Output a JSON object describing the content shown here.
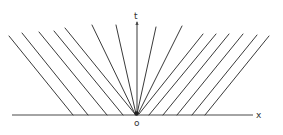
{
  "figure": {
    "labels": {
      "t_axis": "t",
      "x_axis": "x",
      "origin": "o"
    },
    "colors": {
      "line": "#3a3a3a",
      "axis": "#4a4a4a",
      "background": "#ffffff"
    },
    "axes": {
      "x_axis": {
        "x1": 12,
        "y1": 115,
        "x2": 253,
        "y2": 115
      },
      "t_axis": {
        "x1": 137,
        "y1": 115,
        "x2": 137,
        "y2": 22
      }
    },
    "left_lines": [
      {
        "x1": 9,
        "y1": 36,
        "x2": 73,
        "y2": 115
      },
      {
        "x1": 22,
        "y1": 33,
        "x2": 88,
        "y2": 115
      },
      {
        "x1": 39,
        "y1": 32,
        "x2": 107,
        "y2": 115
      },
      {
        "x1": 54,
        "y1": 31,
        "x2": 123,
        "y2": 115
      },
      {
        "x1": 65,
        "y1": 28,
        "x2": 135,
        "y2": 114
      },
      {
        "x1": 92,
        "y1": 25,
        "x2": 135,
        "y2": 114
      },
      {
        "x1": 116,
        "y1": 25,
        "x2": 136,
        "y2": 114
      }
    ],
    "right_lines": [
      {
        "x1": 156,
        "y1": 27,
        "x2": 137,
        "y2": 114
      },
      {
        "x1": 182,
        "y1": 26,
        "x2": 138,
        "y2": 114
      },
      {
        "x1": 203,
        "y1": 34,
        "x2": 139,
        "y2": 114
      },
      {
        "x1": 216,
        "y1": 34,
        "x2": 149,
        "y2": 115
      },
      {
        "x1": 229,
        "y1": 34,
        "x2": 163,
        "y2": 115
      },
      {
        "x1": 243,
        "y1": 34,
        "x2": 177,
        "y2": 115
      },
      {
        "x1": 257,
        "y1": 35,
        "x2": 192,
        "y2": 115
      },
      {
        "x1": 269,
        "y1": 36,
        "x2": 205,
        "y2": 115
      }
    ]
  }
}
